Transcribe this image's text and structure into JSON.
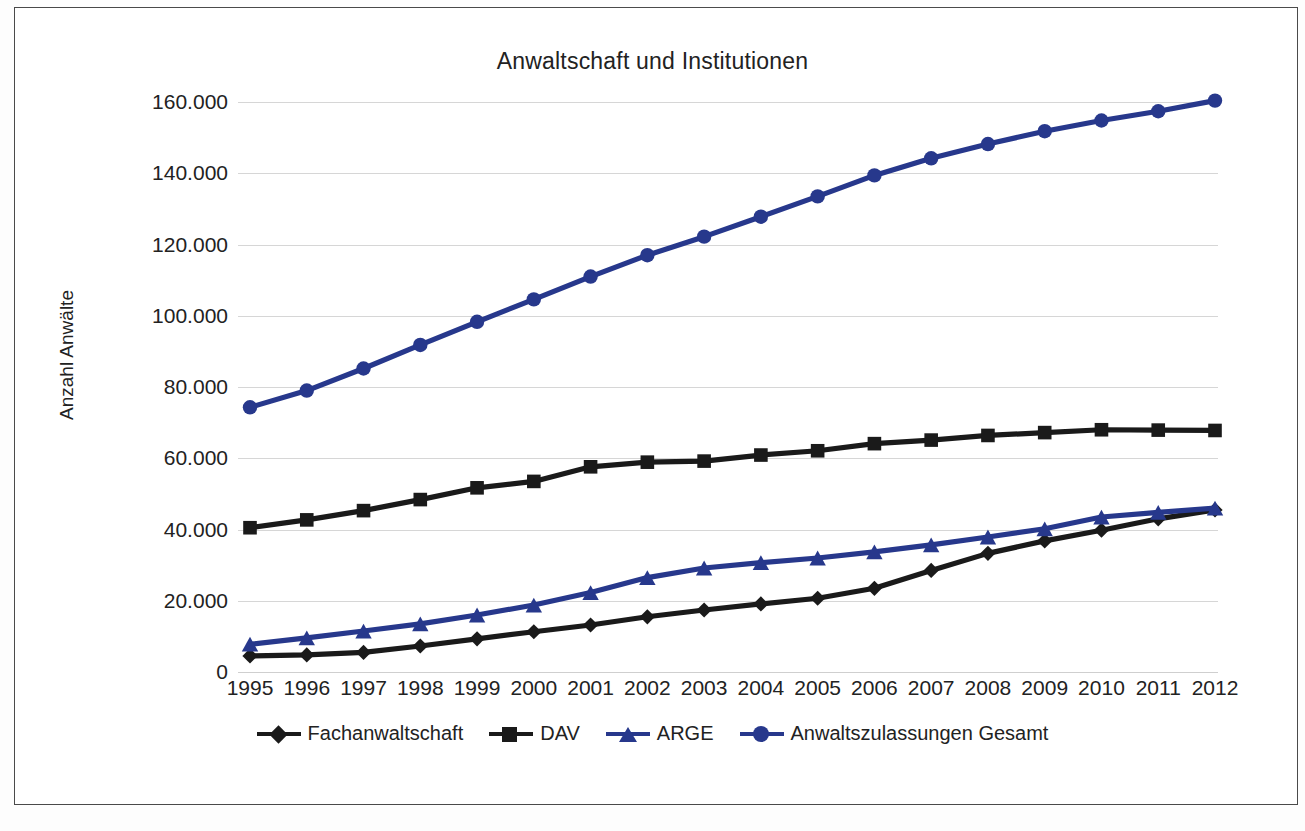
{
  "chart_data": {
    "type": "line",
    "title": "Anwaltschaft und Institutionen",
    "xlabel": "",
    "ylabel": "Anzahl Anwälte",
    "ylim": [
      0,
      160000
    ],
    "ytick_step": 20000,
    "grid": true,
    "legend_position": "bottom",
    "categories": [
      "1995",
      "1996",
      "1997",
      "1998",
      "1999",
      "2000",
      "2001",
      "2002",
      "2003",
      "2004",
      "2005",
      "2006",
      "2007",
      "2008",
      "2009",
      "2010",
      "2011",
      "2012"
    ],
    "ytick_labels": [
      "160.000",
      "140.000",
      "120.000",
      "100.000",
      "80.000",
      "60.000",
      "40.000",
      "20.000",
      "0"
    ],
    "ytick_values": [
      160000,
      140000,
      120000,
      100000,
      80000,
      60000,
      40000,
      20000,
      0
    ],
    "series": [
      {
        "name": "Fachanwaltschaft",
        "color": "#1a1a1a",
        "marker": "diamond",
        "values": [
          4500,
          4800,
          5500,
          7300,
          9300,
          11300,
          13200,
          15500,
          17400,
          19100,
          20700,
          23500,
          28500,
          33300,
          36800,
          39800,
          43000,
          45500
        ]
      },
      {
        "name": "DAV",
        "color": "#1a1a1a",
        "marker": "square",
        "values": [
          40500,
          42700,
          45300,
          48400,
          51700,
          53500,
          57600,
          58900,
          59200,
          60900,
          62100,
          64100,
          65100,
          66400,
          67200,
          68000,
          67900,
          67800
        ]
      },
      {
        "name": "ARGE",
        "color": "#27388c",
        "marker": "triangle",
        "values": [
          7800,
          9600,
          11500,
          13500,
          16000,
          18800,
          22300,
          26500,
          29200,
          30700,
          32000,
          33700,
          35700,
          37900,
          40200,
          43500,
          44800,
          46000
        ]
      },
      {
        "name": "Anwaltszulassungen Gesamt",
        "color": "#27388c",
        "marker": "circle",
        "values": [
          74300,
          79000,
          85200,
          91800,
          98300,
          104600,
          111000,
          117000,
          122200,
          127800,
          133500,
          139400,
          144200,
          148200,
          151800,
          154800,
          157400,
          160400
        ]
      }
    ]
  }
}
